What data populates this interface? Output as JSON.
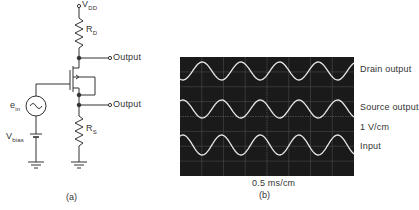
{
  "circuit": {
    "supply_label": "V",
    "supply_sub": "DD",
    "drain_resistor": "R",
    "drain_resistor_sub": "D",
    "source_resistor": "R",
    "source_resistor_sub": "S",
    "source_label": "e",
    "source_sub": "in",
    "bias_label": "V",
    "bias_sub": "bias",
    "output_drain": "Output",
    "output_source": "Output",
    "caption": "(a)"
  },
  "scope": {
    "caption": "(b)",
    "timebase": "0.5 ms/cm",
    "vertical_scale": "1 V/cm",
    "traces": [
      {
        "label": "Drain output",
        "phase": "inverted"
      },
      {
        "label": "Source output",
        "phase": "in-phase"
      },
      {
        "label": "Input",
        "phase": "in-phase"
      }
    ],
    "colors": {
      "screen": "#1a1a1a",
      "trace": "#e8e8e8",
      "grid": "#555555"
    }
  },
  "chart_data": {
    "type": "line",
    "xlabel": "0.5 ms/cm",
    "ylabel": "1 V/cm",
    "grid": true,
    "series": [
      {
        "name": "Drain output",
        "shape": "sine",
        "cycles": 4.5,
        "phase_deg": 180
      },
      {
        "name": "Source output",
        "shape": "sine",
        "cycles": 4.5,
        "phase_deg": 0
      },
      {
        "name": "Input",
        "shape": "sine",
        "cycles": 4.5,
        "phase_deg": 0
      }
    ]
  }
}
